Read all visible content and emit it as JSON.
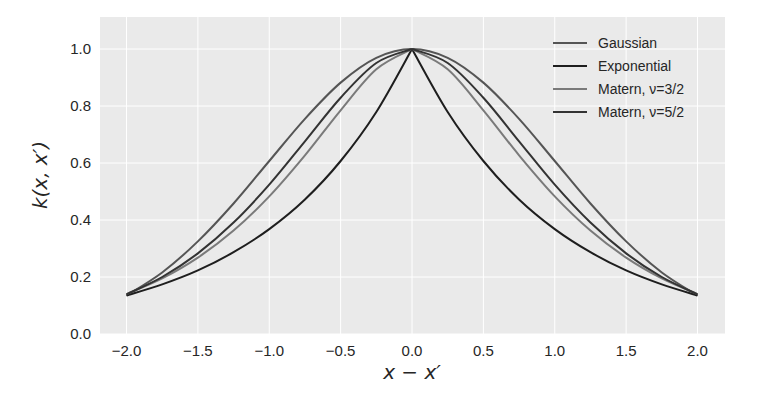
{
  "chart_data": {
    "type": "line",
    "title": "",
    "xlabel": "x − x′",
    "ylabel": "k(x, x′)",
    "xlim": [
      -2.2,
      2.2
    ],
    "ylim": [
      0.0,
      1.1
    ],
    "grid": true,
    "legend_position": "upper right",
    "x_ticks": [
      "−2.0",
      "−1.5",
      "−1.0",
      "−0.5",
      "0.0",
      "0.5",
      "1.0",
      "1.5",
      "2.0"
    ],
    "y_ticks": [
      "0.0",
      "0.2",
      "0.4",
      "0.6",
      "0.8",
      "1.0"
    ],
    "x": [
      -2.0,
      -1.75,
      -1.5,
      -1.25,
      -1.0,
      -0.75,
      -0.5,
      -0.25,
      0.0,
      0.25,
      0.5,
      0.75,
      1.0,
      1.25,
      1.5,
      1.75,
      2.0
    ],
    "series": [
      {
        "name": "Gaussian",
        "color": "#555555",
        "values": [
          0.135,
          0.216,
          0.325,
          0.458,
          0.607,
          0.755,
          0.882,
          0.969,
          1.0,
          0.969,
          0.882,
          0.755,
          0.607,
          0.458,
          0.325,
          0.216,
          0.135
        ]
      },
      {
        "name": "Exponential",
        "color": "#1e1e1e",
        "values": [
          0.135,
          0.174,
          0.223,
          0.287,
          0.368,
          0.472,
          0.607,
          0.779,
          1.0,
          0.779,
          0.607,
          0.472,
          0.368,
          0.287,
          0.223,
          0.174,
          0.135
        ]
      },
      {
        "name": "Matern, ν=3/2",
        "color": "#7a7a7a",
        "values": [
          0.14,
          0.195,
          0.268,
          0.363,
          0.483,
          0.627,
          0.785,
          0.929,
          1.0,
          0.929,
          0.785,
          0.627,
          0.483,
          0.363,
          0.268,
          0.195,
          0.14
        ]
      },
      {
        "name": "Matern, ν=5/2",
        "color": "#333333",
        "values": [
          0.139,
          0.2,
          0.283,
          0.391,
          0.524,
          0.676,
          0.829,
          0.951,
          1.0,
          0.951,
          0.829,
          0.676,
          0.524,
          0.391,
          0.283,
          0.2,
          0.139
        ]
      }
    ]
  },
  "legend": {
    "items": [
      {
        "label": "Gaussian",
        "color": "#555555"
      },
      {
        "label": "Exponential",
        "color": "#1e1e1e"
      },
      {
        "label": "Matern, ν=3/2",
        "color": "#7a7a7a"
      },
      {
        "label": "Matern, ν=5/2",
        "color": "#333333"
      }
    ]
  },
  "style": {
    "plot_background": "#eaeaea",
    "grid_color": "#ffffff"
  }
}
